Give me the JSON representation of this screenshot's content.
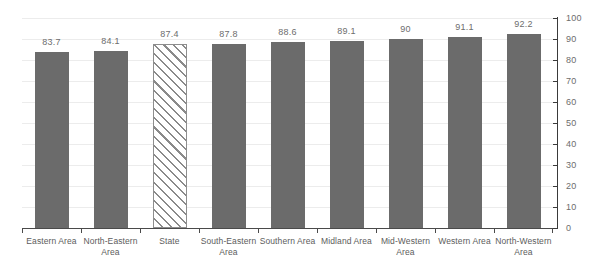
{
  "chart_data": {
    "type": "bar",
    "title": "",
    "xlabel": "",
    "ylabel": "",
    "ylim": [
      0,
      100
    ],
    "yticks": [
      0,
      10,
      20,
      30,
      40,
      50,
      60,
      70,
      80,
      90,
      100
    ],
    "ytick_labels": [
      "0",
      "10",
      "20",
      "30",
      "40",
      "50",
      "60",
      "70",
      "80",
      "90",
      "100"
    ],
    "grid": true,
    "legend": null,
    "axis_position": "right",
    "categories": [
      "Eastern Area",
      "North-Eastern Area",
      "State",
      "South-Eastern Area",
      "Southern Area",
      "Midland Area",
      "Mid-Western Area",
      "Western Area",
      "North-Western Area"
    ],
    "values": [
      83.7,
      84.1,
      87.4,
      87.8,
      88.6,
      89.1,
      90,
      91.1,
      92.2
    ],
    "value_labels": [
      "83.7",
      "84.1",
      "87.4",
      "87.8",
      "88.6",
      "89.1",
      "90",
      "91.1",
      "92.2"
    ],
    "bar_styles": [
      "solid",
      "solid",
      "hatched",
      "solid",
      "solid",
      "solid",
      "solid",
      "solid",
      "solid"
    ],
    "colors": {
      "bar_fill": "#6b6b6b",
      "hatch_line": "#8a8a8a",
      "hatch_background": "#ffffff",
      "gridline": "#ececec",
      "axis_line": "#3a3a3a",
      "baseline": "#4a4a4a",
      "label_text": "#6d6d6d",
      "category_text": "#5c5c5c",
      "background": "#ffffff"
    }
  }
}
